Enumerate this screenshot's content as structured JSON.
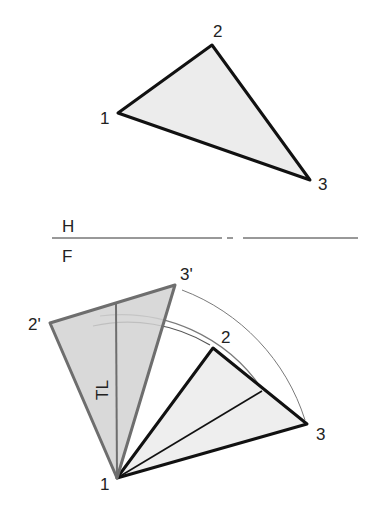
{
  "diagram": {
    "type": "descriptive-geometry-rotation",
    "colors": {
      "background": "#ffffff",
      "edge": "#111111",
      "rotated_edge": "#6e6e6e",
      "fill_light": "#e9e9e9",
      "fill_rotated": "#cfcfcf",
      "arc": "#777777"
    },
    "top_view": {
      "labels": {
        "p1": "1",
        "p2": "2",
        "p3": "3"
      },
      "points": {
        "p1": [
          118,
          113
        ],
        "p2": [
          212,
          45
        ],
        "p3": [
          310,
          180
        ]
      }
    },
    "fold_line": {
      "upper_label": "H",
      "lower_label": "F",
      "y": 238,
      "x_start": 52,
      "x_end": 358
    },
    "front_view": {
      "labels": {
        "p1": "1",
        "p2": "2",
        "p3": "3",
        "p2_rot": "2'",
        "p3_rot": "3'",
        "true_length": "TL"
      },
      "points": {
        "p1": [
          117,
          478
        ],
        "p2": [
          213,
          348
        ],
        "p3": [
          307,
          424
        ],
        "p2_rot": [
          50,
          323
        ],
        "p3_rot": [
          175,
          285
        ],
        "edge_point": [
          262,
          391
        ],
        "tl_top": [
          116,
          304
        ]
      }
    }
  }
}
